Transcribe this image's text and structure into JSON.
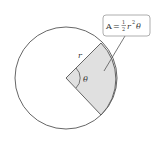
{
  "diagram": {
    "radius_label": "r",
    "angle_label": "θ",
    "formula": {
      "lhs": "A",
      "equals": "=",
      "frac_num": "1",
      "frac_den": "2",
      "r": "r",
      "exp": "2",
      "theta": "θ"
    },
    "colors": {
      "stroke": "#555555",
      "sector_fill": "#e0e0e0",
      "box_border": "#999999"
    }
  }
}
